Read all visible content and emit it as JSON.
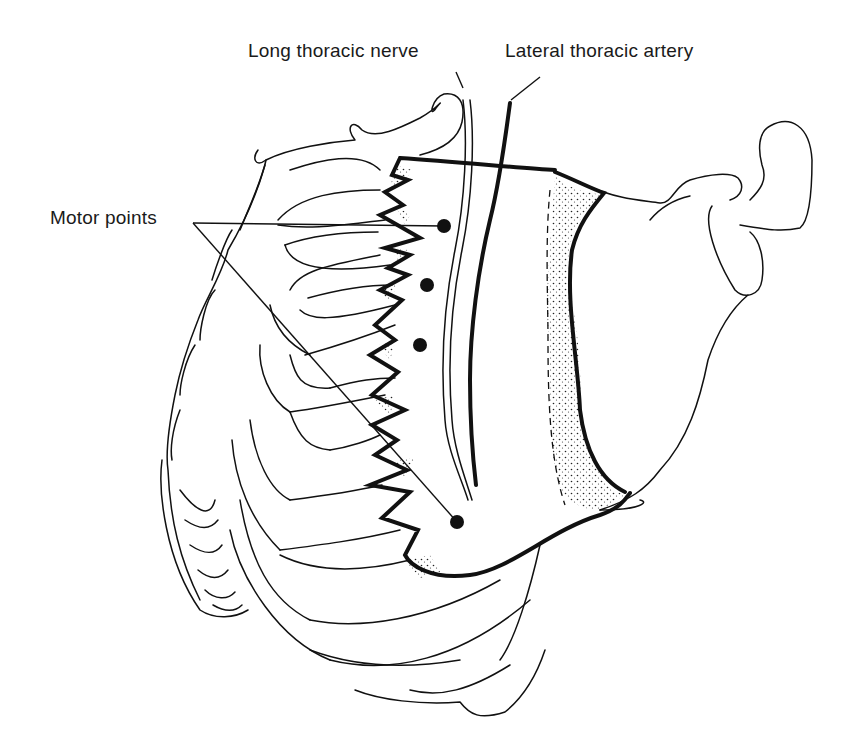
{
  "figure": {
    "labels": {
      "long_thoracic_nerve": "Long thoracic nerve",
      "lateral_thoracic_artery": "Lateral thoracic artery",
      "motor_points": "Motor points"
    },
    "motor_points": [
      {
        "x": 444,
        "y": 226
      },
      {
        "x": 427,
        "y": 285
      },
      {
        "x": 420,
        "y": 345
      },
      {
        "x": 457,
        "y": 522
      }
    ],
    "colors": {
      "ink": "#111111",
      "background": "#ffffff"
    }
  }
}
